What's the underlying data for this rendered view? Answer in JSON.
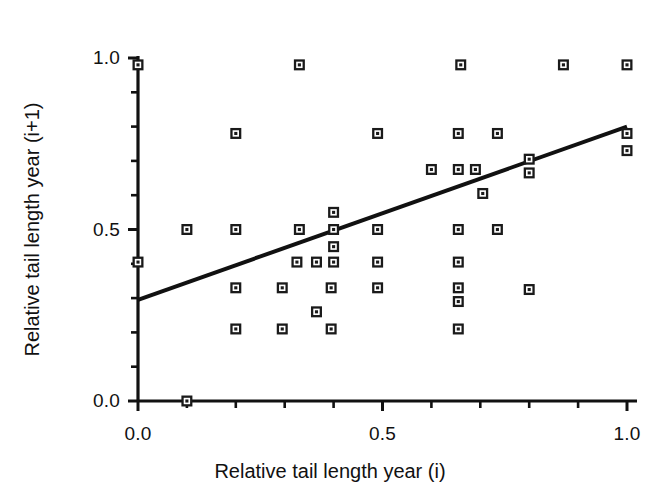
{
  "chart_data": {
    "type": "scatter",
    "title": "",
    "xlabel": "Relative tail length year (i)",
    "ylabel": "Relative tail length year (i+1)",
    "xlim": [
      0.0,
      1.0
    ],
    "ylim": [
      0.0,
      1.0
    ],
    "grid": false,
    "legend": "none",
    "x_ticks_major": [
      0.0,
      0.5,
      1.0
    ],
    "x_tick_labels": [
      "0.0",
      "0.5",
      "1.0"
    ],
    "y_ticks_major": [
      0.0,
      0.5,
      1.0
    ],
    "y_tick_labels": [
      "0.0",
      "0.5",
      "1.0"
    ],
    "x_ticks_minor": [
      0.1,
      0.2,
      0.3,
      0.4,
      0.6,
      0.7,
      0.8,
      0.9
    ],
    "y_ticks_minor": [
      0.1,
      0.2,
      0.3,
      0.4,
      0.6,
      0.7,
      0.8,
      0.9
    ],
    "marker": "open-square-with-dot",
    "marker_color": "#1a1a1a",
    "marker_size": 11,
    "points": [
      {
        "x": 0.0,
        "y": 0.98
      },
      {
        "x": 0.33,
        "y": 0.98
      },
      {
        "x": 0.66,
        "y": 0.98
      },
      {
        "x": 0.87,
        "y": 0.98
      },
      {
        "x": 1.0,
        "y": 0.98
      },
      {
        "x": 0.2,
        "y": 0.78
      },
      {
        "x": 0.49,
        "y": 0.78
      },
      {
        "x": 0.655,
        "y": 0.78
      },
      {
        "x": 0.735,
        "y": 0.78
      },
      {
        "x": 1.0,
        "y": 0.78
      },
      {
        "x": 1.0,
        "y": 0.73
      },
      {
        "x": 0.8,
        "y": 0.705
      },
      {
        "x": 0.6,
        "y": 0.675
      },
      {
        "x": 0.655,
        "y": 0.675
      },
      {
        "x": 0.69,
        "y": 0.675
      },
      {
        "x": 0.8,
        "y": 0.665
      },
      {
        "x": 0.705,
        "y": 0.605
      },
      {
        "x": 0.4,
        "y": 0.55
      },
      {
        "x": 0.1,
        "y": 0.5
      },
      {
        "x": 0.2,
        "y": 0.5
      },
      {
        "x": 0.33,
        "y": 0.5
      },
      {
        "x": 0.4,
        "y": 0.5
      },
      {
        "x": 0.49,
        "y": 0.5
      },
      {
        "x": 0.655,
        "y": 0.5
      },
      {
        "x": 0.735,
        "y": 0.5
      },
      {
        "x": 0.4,
        "y": 0.45
      },
      {
        "x": 0.0,
        "y": 0.405
      },
      {
        "x": 0.325,
        "y": 0.405
      },
      {
        "x": 0.365,
        "y": 0.405
      },
      {
        "x": 0.4,
        "y": 0.405
      },
      {
        "x": 0.49,
        "y": 0.405
      },
      {
        "x": 0.655,
        "y": 0.405
      },
      {
        "x": 0.2,
        "y": 0.33
      },
      {
        "x": 0.295,
        "y": 0.33
      },
      {
        "x": 0.395,
        "y": 0.33
      },
      {
        "x": 0.49,
        "y": 0.33
      },
      {
        "x": 0.655,
        "y": 0.33
      },
      {
        "x": 0.8,
        "y": 0.325
      },
      {
        "x": 0.655,
        "y": 0.29
      },
      {
        "x": 0.365,
        "y": 0.26
      },
      {
        "x": 0.2,
        "y": 0.21
      },
      {
        "x": 0.295,
        "y": 0.21
      },
      {
        "x": 0.395,
        "y": 0.21
      },
      {
        "x": 0.655,
        "y": 0.21
      },
      {
        "x": 0.1,
        "y": 0.0
      }
    ],
    "trendline": {
      "label": "regression line",
      "x_start": 0.0,
      "y_start": 0.295,
      "x_end": 1.0,
      "y_end": 0.8,
      "color": "#111111",
      "width": 4
    }
  },
  "axis": {
    "x_title": "Relative tail length year (i)",
    "y_title": "Relative tail length year (i+1)",
    "x_labels": [
      "0.0",
      "0.5",
      "1.0"
    ],
    "y_labels": [
      "0.0",
      "0.5",
      "1.0"
    ]
  }
}
